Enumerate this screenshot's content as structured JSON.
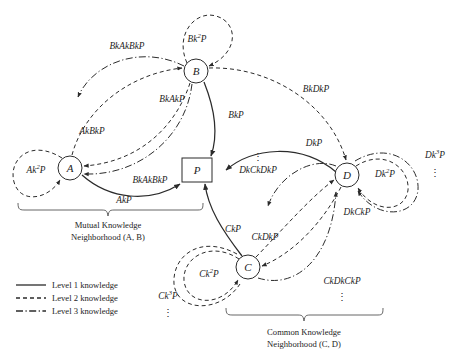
{
  "figure": {
    "background_color": "#ffffff",
    "stroke_color": "#2b2b2b",
    "brace_color": "#555555"
  },
  "nodes": [
    {
      "id": "A",
      "label": "A",
      "shape": "circle",
      "x": 70,
      "y": 168,
      "r": 12
    },
    {
      "id": "B",
      "label": "B",
      "shape": "circle",
      "x": 196,
      "y": 71,
      "r": 12
    },
    {
      "id": "C",
      "label": "C",
      "shape": "circle",
      "x": 248,
      "y": 267,
      "r": 12
    },
    {
      "id": "D",
      "label": "D",
      "shape": "circle",
      "x": 347,
      "y": 175,
      "r": 12
    },
    {
      "id": "P",
      "label": "P",
      "shape": "rect",
      "x": 197,
      "y": 170,
      "w": 30,
      "h": 24
    }
  ],
  "edges": [
    {
      "id": "A-P",
      "label": "AkP",
      "level": 1,
      "from": "A",
      "to": "P"
    },
    {
      "id": "B-P",
      "label": "BkP",
      "level": 1,
      "from": "B",
      "to": "P"
    },
    {
      "id": "C-P",
      "label": "CkP",
      "level": 1,
      "from": "C",
      "to": "P"
    },
    {
      "id": "D-P",
      "label": "DkP",
      "level": 1,
      "from": "D",
      "to": "P"
    },
    {
      "id": "B-A",
      "label": "BkAkP",
      "level": 2,
      "from": "B",
      "to": "A"
    },
    {
      "id": "A-B",
      "label": "AkBkP",
      "level": 2,
      "from": "A",
      "to": "B"
    },
    {
      "id": "B-D",
      "label": "BkDkP",
      "level": 2,
      "from": "B",
      "to": "D"
    },
    {
      "id": "C-D",
      "label": "CkDkP",
      "level": 2,
      "from": "C",
      "to": "D"
    },
    {
      "id": "D-C",
      "label": "DkCkP",
      "level": 2,
      "from": "D",
      "to": "C"
    },
    {
      "id": "B-A-B",
      "label": "BkAkBkP",
      "level": 3,
      "from": "B",
      "to": "A"
    },
    {
      "id": "B-A-B2",
      "label": "BkAkBkP",
      "level": 3,
      "from": "B",
      "to": "A"
    },
    {
      "id": "D-C-D",
      "label": "DkCkDkP",
      "level": 3,
      "from": "D",
      "to": "C"
    },
    {
      "id": "C-D-C",
      "label": "CkDkCkP",
      "level": 3,
      "from": "C",
      "to": "D"
    }
  ],
  "self_loops": [
    {
      "node": "A",
      "label_base": "Ak",
      "label_sup": "2",
      "label_tail": "P",
      "level": 2
    },
    {
      "node": "B",
      "label_base": "Bk",
      "label_sup": "2",
      "label_tail": "P",
      "level": 2
    },
    {
      "node": "C",
      "label_base": "Ck",
      "label_sup": "2",
      "label_tail": "P",
      "level": 2
    },
    {
      "node": "C",
      "label_base": "Ck",
      "label_sup": "3",
      "label_tail": "P",
      "level": 3
    },
    {
      "node": "D",
      "label_base": "Dk",
      "label_sup": "2",
      "label_tail": "P",
      "level": 2
    },
    {
      "node": "D",
      "label_base": "Dk",
      "label_sup": "3",
      "label_tail": "P",
      "level": 3
    }
  ],
  "labels": {
    "node_a": "A",
    "node_b": "B",
    "node_c": "C",
    "node_d": "D",
    "node_p": "P",
    "akp": "AkP",
    "bkp": "BkP",
    "ckp": "CkP",
    "dkp": "DkP",
    "bkakp": "BkAkP",
    "akbkp": "AkBkP",
    "bkdkp": "BkDkP",
    "ckdkp": "CkDkP",
    "dkckp": "DkCkP",
    "bkakbkp_top": "BkAkBkP",
    "bkakbkp_bottom": "BkAkBkP",
    "dkckdkp": "DkCkDkP",
    "ckdkckp": "CkDkCkP",
    "ak2p_base": "Ak",
    "ak2p_sup": "2",
    "ak2p_tail": "P",
    "bk2p_base": "Bk",
    "bk2p_sup": "2",
    "bk2p_tail": "P",
    "ck2p_base": "Ck",
    "ck2p_sup": "2",
    "ck2p_tail": "P",
    "ck3p_base": "Ck",
    "ck3p_sup": "3",
    "ck3p_tail": "P",
    "dk2p_base": "Dk",
    "dk2p_sup": "2",
    "dk2p_tail": "P",
    "dk3p_base": "Dk",
    "dk3p_sup": "3",
    "dk3p_tail": "P",
    "ellipsis": "⋮"
  },
  "groups": [
    {
      "id": "mutual",
      "line1": "Mutual Knowledge",
      "line2": "Neighborhood (A, B)"
    },
    {
      "id": "common",
      "line1": "Common Knowledge",
      "line2": "Neighborhood (C, D)"
    }
  ],
  "legend": {
    "items": [
      {
        "label": "Level 1 knowledge",
        "level": 1,
        "style": "solid"
      },
      {
        "label": "Level 2 knowledge",
        "level": 2,
        "style": "dashed"
      },
      {
        "label": "Level 3 knowledge",
        "level": 3,
        "style": "dash-dot"
      }
    ]
  }
}
